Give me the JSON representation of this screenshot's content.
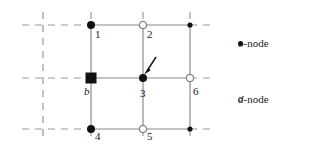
{
  "figure": {
    "type": "node-grid-diagram",
    "background": "#ffffff",
    "width": 309,
    "height": 150,
    "colors": {
      "solid_line": "#808080",
      "dashed_line": "#9a9a9a",
      "filled_node": "#111111",
      "open_node_stroke": "#808080",
      "open_node_fill": "#ffffff",
      "text": "#1a1a1a",
      "arrow": "#111111"
    },
    "grid": {
      "columns_x": [
        43,
        91,
        143,
        190
      ],
      "rows_y": [
        25,
        78,
        129
      ]
    },
    "nodes": [
      {
        "id": "b",
        "label": "b",
        "label_italic": true,
        "shape": "square",
        "fill": "filled",
        "x": 91,
        "y": 78,
        "label_dx": -7,
        "label_dy": 8
      },
      {
        "id": "1",
        "label": "1",
        "label_italic": false,
        "shape": "circle",
        "fill": "filled",
        "x": 91,
        "y": 25,
        "label_dx": 3,
        "label_dy": 6
      },
      {
        "id": "2",
        "label": "2",
        "label_italic": false,
        "shape": "circle",
        "fill": "open",
        "x": 143,
        "y": 25,
        "label_dx": 3,
        "label_dy": 6
      },
      {
        "id": "tr",
        "label": "",
        "label_italic": false,
        "shape": "circle",
        "fill": "filled-small",
        "x": 190,
        "y": 25,
        "label_dx": 0,
        "label_dy": 0
      },
      {
        "id": "3",
        "label": "3",
        "label_italic": false,
        "shape": "circle",
        "fill": "filled",
        "x": 143,
        "y": 78,
        "label_dx": 3,
        "label_dy": 6
      },
      {
        "id": "6",
        "label": "6",
        "label_italic": false,
        "shape": "circle",
        "fill": "open",
        "x": 190,
        "y": 78,
        "label_dx": 3,
        "label_dy": 6
      },
      {
        "id": "4",
        "label": "4",
        "label_italic": false,
        "shape": "circle",
        "fill": "filled",
        "x": 91,
        "y": 129,
        "label_dx": 3,
        "label_dy": 6
      },
      {
        "id": "5",
        "label": "5",
        "label_italic": false,
        "shape": "circle",
        "fill": "open",
        "x": 143,
        "y": 129,
        "label_dx": 3,
        "label_dy": 6
      },
      {
        "id": "br",
        "label": "",
        "label_italic": false,
        "shape": "circle",
        "fill": "filled-small",
        "x": 190,
        "y": 129,
        "label_dx": 0,
        "label_dy": 0
      }
    ],
    "arrow": {
      "name": "pointer-arrow-to-node-3",
      "from_x": 156,
      "from_y": 58,
      "to_x": 145,
      "to_y": 73
    },
    "legend": {
      "entries": [
        {
          "marker": "filled-dot",
          "symbol": "o",
          "text": "-node",
          "x": 238,
          "y": 46
        },
        {
          "marker": "open-dot",
          "symbol": "d",
          "text": "-node",
          "x": 238,
          "y": 102
        }
      ]
    }
  }
}
